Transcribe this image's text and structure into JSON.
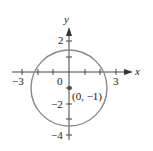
{
  "figure": {
    "axes": {
      "x_label": "x",
      "y_label": "y",
      "x_ticks": [
        "−3",
        "3"
      ],
      "y_ticks": [
        "2",
        "−2",
        "−4"
      ],
      "origin_label": "0"
    },
    "circle": {
      "center": [
        0,
        -1
      ],
      "radius": 2.5,
      "stroke_color": "#888888"
    },
    "point": {
      "label": "(0, −1)",
      "color": "#555555"
    }
  }
}
